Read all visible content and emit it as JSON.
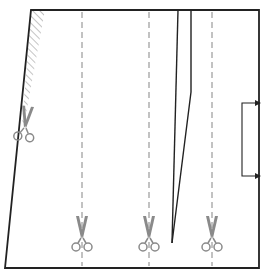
{
  "diagram": {
    "colors": {
      "outline": "#222222",
      "dash": "#9a9a9a",
      "scissors": "#8a8a8a",
      "hatch": "#8a8a8a",
      "background": "#ffffff"
    },
    "outline": {
      "points": [
        [
          31,
          10
        ],
        [
          259,
          10
        ],
        [
          259,
          268
        ],
        [
          5,
          268
        ]
      ]
    },
    "hatch_area": {
      "points": [
        [
          31,
          10
        ],
        [
          45,
          10
        ],
        [
          24,
          125
        ],
        [
          22,
          125
        ]
      ]
    },
    "dart": {
      "left_leg": [
        [
          178,
          10
        ],
        [
          172,
          243
        ]
      ],
      "right_leg": [
        [
          191,
          10
        ],
        [
          191,
          92
        ],
        [
          172,
          243
        ]
      ]
    },
    "cut_lines": [
      {
        "x": 82,
        "y1": 12,
        "y2": 266
      },
      {
        "x": 149,
        "y1": 12,
        "y2": 266
      },
      {
        "x": 212,
        "y1": 12,
        "y2": 266
      }
    ],
    "scissors": [
      {
        "name": "scissors-icon-left-edge",
        "x": 25,
        "y": 128,
        "angle": 8
      },
      {
        "name": "scissors-icon-cut-1",
        "x": 82,
        "y": 238,
        "angle": 0
      },
      {
        "name": "scissors-icon-cut-2",
        "x": 149,
        "y": 238,
        "angle": 0
      },
      {
        "name": "scissors-icon-cut-3",
        "x": 212,
        "y": 238,
        "angle": 0
      }
    ],
    "grain_bracket": {
      "x": 242,
      "y_top": 103,
      "y_bottom": 176,
      "arrow_x": 256
    }
  }
}
